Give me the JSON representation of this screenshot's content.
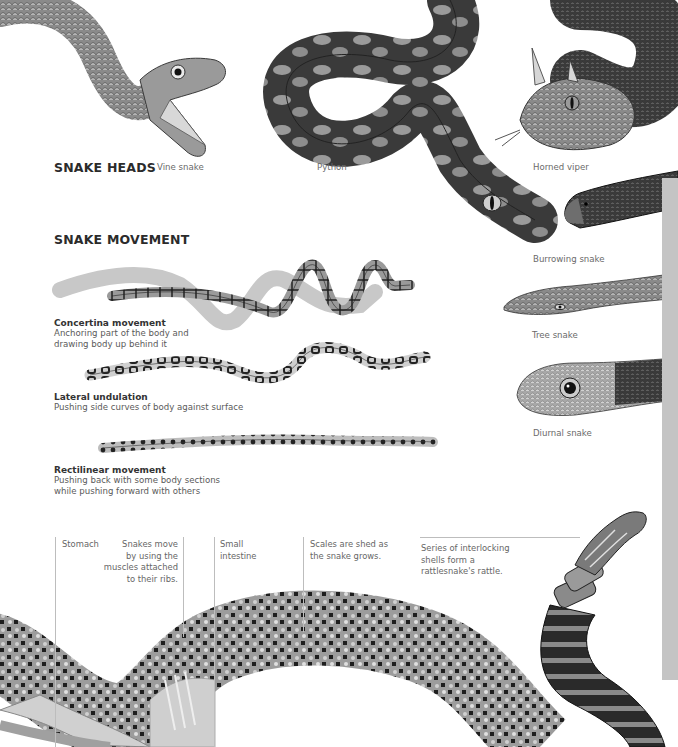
{
  "sections": {
    "heads_title": "SNAKE HEADS",
    "movement_title": "SNAKE MOVEMENT"
  },
  "heads": [
    {
      "name": "Vine snake"
    },
    {
      "name": "Python"
    },
    {
      "name": "Horned viper"
    },
    {
      "name": "Burrowing snake"
    },
    {
      "name": "Tree snake"
    },
    {
      "name": "Diurnal snake"
    }
  ],
  "movements": [
    {
      "title": "Concertina movement",
      "desc_line1": "Anchoring part of the body and",
      "desc_line2": "drawing body up behind it"
    },
    {
      "title": "Lateral undulation",
      "desc_line1": "Pushing side curves of body against surface",
      "desc_line2": ""
    },
    {
      "title": "Rectilinear movement",
      "desc_line1": "Pushing back with some body sections",
      "desc_line2": "while pushing forward with others"
    }
  ],
  "annotations": {
    "stomach": "Stomach",
    "ribs_line1": "Snakes move",
    "ribs_line2": "by using the",
    "ribs_line3": "muscles attached",
    "ribs_line4": "to their ribs.",
    "intestine_line1": "Small",
    "intestine_line2": "intestine",
    "scales_line1": "Scales are shed as",
    "scales_line2": "the snake grows.",
    "rattle_line1": "Series of interlocking",
    "rattle_line2": "shells form a",
    "rattle_line3": "rattlesnake's rattle."
  },
  "colors": {
    "side_bar": "#c4c4c4",
    "leader_line": "#bdbdbd",
    "title_text": "#2b2b2b",
    "caption_text": "#6a6a6a"
  }
}
